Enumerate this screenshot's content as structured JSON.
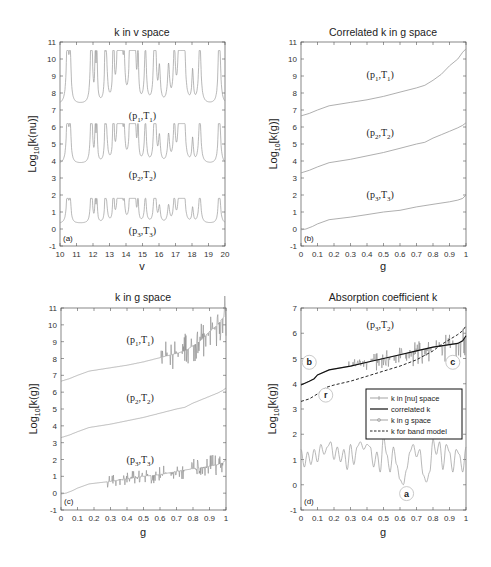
{
  "chart_data": [
    {
      "id": "a",
      "type": "line",
      "title": "k in v space",
      "xlabel": "v",
      "ylabel": "Log10[k(nu)]",
      "xlim": [
        10,
        20
      ],
      "ylim": [
        -1,
        11
      ],
      "xticks": [
        "10",
        "11",
        "12",
        "13",
        "14",
        "15",
        "16",
        "17",
        "18",
        "19",
        "20"
      ],
      "yticks": [
        "-1",
        "0",
        "1",
        "2",
        "3",
        "4",
        "5",
        "6",
        "7",
        "8",
        "9",
        "10",
        "11"
      ],
      "panel_tag": "(a)",
      "annotations": [
        {
          "text": "(p1,T1)",
          "main": "(p",
          "s1": "1",
          "mid": ",T",
          "s2": "1",
          "x": 15,
          "y": 6.5
        },
        {
          "text": "(p2,T2)",
          "main": "(p",
          "s1": "2",
          "mid": ",T",
          "s2": "2",
          "x": 15,
          "y": 3.0
        },
        {
          "text": "(p3,T3)",
          "main": "(p",
          "s1": "3",
          "mid": ",T",
          "s2": "3",
          "x": 15,
          "y": -0.3
        }
      ],
      "series": [
        {
          "name": "(p1,T1)",
          "baseline": 7.3,
          "peak": 10.5,
          "style": "gray-line"
        },
        {
          "name": "(p2,T2)",
          "baseline": 3.8,
          "peak": 6.2,
          "style": "gray-line"
        },
        {
          "name": "(p3,T3)",
          "baseline": 0.3,
          "peak": 1.8,
          "style": "gray-line"
        }
      ],
      "grid": false
    },
    {
      "id": "b",
      "type": "line",
      "title": "Correlated k in g space",
      "xlabel": "g",
      "ylabel": "Log10[k(g)]",
      "xlim": [
        0,
        1
      ],
      "ylim": [
        -1,
        11
      ],
      "xticks": [
        "0",
        "0.1",
        "0.2",
        "0.3",
        "0.4",
        "0.5",
        "0.6",
        "0.7",
        "0.8",
        "0.9",
        "1"
      ],
      "yticks": [
        "-1",
        "0",
        "1",
        "2",
        "3",
        "4",
        "5",
        "6",
        "7",
        "8",
        "9",
        "10",
        "11"
      ],
      "panel_tag": "(b)",
      "annotations": [
        {
          "text": "(p1,T1)",
          "main": "(p",
          "s1": "1",
          "mid": ",T",
          "s2": "1",
          "x": 0.48,
          "y": 8.9
        },
        {
          "text": "(p2,T2)",
          "main": "(p",
          "s1": "2",
          "mid": ",T",
          "s2": "2",
          "x": 0.48,
          "y": 5.5
        },
        {
          "text": "(p3,T3)",
          "main": "(p",
          "s1": "3",
          "mid": ",T",
          "s2": "3",
          "x": 0.48,
          "y": 1.8
        }
      ],
      "series": [
        {
          "name": "(p1,T1)",
          "x": [
            0,
            0.05,
            0.1,
            0.17,
            0.3,
            0.4,
            0.5,
            0.6,
            0.7,
            0.75,
            0.8,
            0.85,
            0.9,
            0.95,
            0.98,
            1.0
          ],
          "y": [
            6.65,
            6.8,
            7.0,
            7.25,
            7.45,
            7.6,
            7.8,
            8.05,
            8.3,
            8.45,
            8.75,
            9.1,
            9.6,
            10.0,
            10.4,
            10.6
          ]
        },
        {
          "name": "(p2,T2)",
          "x": [
            0,
            0.05,
            0.1,
            0.17,
            0.3,
            0.4,
            0.5,
            0.6,
            0.7,
            0.75,
            0.8,
            0.85,
            0.9,
            0.95,
            0.98,
            1.0
          ],
          "y": [
            3.3,
            3.45,
            3.65,
            3.9,
            4.1,
            4.3,
            4.5,
            4.75,
            5.0,
            5.1,
            5.35,
            5.55,
            5.75,
            5.95,
            6.1,
            6.25
          ]
        },
        {
          "name": "(p3,T3)",
          "x": [
            0,
            0.03,
            0.07,
            0.1,
            0.17,
            0.3,
            0.4,
            0.5,
            0.6,
            0.7,
            0.8,
            0.9,
            0.95,
            0.98,
            1.0
          ],
          "y": [
            -0.05,
            0.0,
            0.15,
            0.3,
            0.55,
            0.7,
            0.85,
            1.0,
            1.1,
            1.3,
            1.45,
            1.6,
            1.7,
            1.8,
            2.0
          ]
        }
      ],
      "grid": false
    },
    {
      "id": "c",
      "type": "line",
      "title": "k in g space",
      "xlabel": "g",
      "ylabel": "Log10[k(g)]",
      "xlim": [
        0,
        1
      ],
      "ylim": [
        -1,
        11
      ],
      "xticks": [
        "0",
        "0.1",
        "0.2",
        "0.3",
        "0.4",
        "0.5",
        "0.6",
        "0.7",
        "0.8",
        "0.9",
        "1"
      ],
      "yticks": [
        "-1",
        "0",
        "1",
        "2",
        "3",
        "4",
        "5",
        "6",
        "7",
        "8",
        "9",
        "10",
        "11"
      ],
      "panel_tag": "(c)",
      "annotations": [
        {
          "text": "(p1,T1)",
          "main": "(p",
          "s1": "1",
          "mid": ",T",
          "s2": "1",
          "x": 0.48,
          "y": 8.9
        },
        {
          "text": "(p2,T2)",
          "main": "(p",
          "s1": "2",
          "mid": ",T",
          "s2": "2",
          "x": 0.48,
          "y": 5.5
        },
        {
          "text": "(p3,T3)",
          "main": "(p",
          "s1": "3",
          "mid": ",T",
          "s2": "3",
          "x": 0.48,
          "y": 1.8
        }
      ],
      "series": [
        {
          "name": "(p1,T1)",
          "noisy_from": 0.6,
          "noise_amp": 0.9
        },
        {
          "name": "(p2,T2)",
          "noisy_from": 1.1,
          "noise_amp": 0
        },
        {
          "name": "(p3,T3)",
          "noisy_from": 0.28,
          "noise_amp": 0.5
        }
      ],
      "grid": false
    },
    {
      "id": "d",
      "type": "line",
      "title": "Absorption coefficient k",
      "xlabel": "g",
      "ylabel": "Log10[k(g)]",
      "xlim": [
        0,
        1
      ],
      "ylim": [
        -1,
        7
      ],
      "xticks": [
        "0",
        "0.1",
        "0.2",
        "0.3",
        "0.4",
        "0.5",
        "0.6",
        "0.7",
        "0.8",
        "0.9",
        "1"
      ],
      "yticks": [
        "-1",
        "0",
        "1",
        "2",
        "3",
        "4",
        "5",
        "6",
        "7"
      ],
      "panel_tag": "(d)",
      "annotations": [
        {
          "text": "(p3,T2)",
          "main": "(p",
          "s1": "3",
          "mid": ",T",
          "s2": "2",
          "x": 0.48,
          "y": 6.2
        }
      ],
      "markers": [
        {
          "label": "b",
          "x": 0.05,
          "y": 4.85
        },
        {
          "label": "r",
          "x": 0.15,
          "y": 3.55
        },
        {
          "label": "c",
          "x": 0.92,
          "y": 4.85
        },
        {
          "label": "a",
          "x": 0.64,
          "y": -0.35
        }
      ],
      "legend": {
        "position": "center-right",
        "entries": [
          {
            "label": "k in [nu] space",
            "style": "gray-marker"
          },
          {
            "label": "correlated k",
            "style": "black-solid"
          },
          {
            "label": "k in g space",
            "style": "gray-circle"
          },
          {
            "label": "k for band model",
            "style": "black-dashed"
          }
        ]
      },
      "series": [
        {
          "name": "k in [nu] space",
          "x": [
            0,
            0.02,
            0.04,
            0.06,
            0.08,
            0.1,
            0.12,
            0.14,
            0.16,
            0.18,
            0.2,
            0.22,
            0.24,
            0.26,
            0.28,
            0.3,
            0.32,
            0.34,
            0.36,
            0.38,
            0.4,
            0.42,
            0.44,
            0.46,
            0.48,
            0.5,
            0.52,
            0.54,
            0.56,
            0.58,
            0.6,
            0.62,
            0.64,
            0.66,
            0.68,
            0.7,
            0.72,
            0.74,
            0.76,
            0.78,
            0.8,
            0.82,
            0.84,
            0.86,
            0.88,
            0.9,
            0.92,
            0.94,
            0.96,
            0.98,
            1.0
          ],
          "y": [
            1.4,
            0.7,
            1.3,
            0.8,
            1.4,
            0.9,
            1.6,
            1.2,
            1.5,
            1.7,
            1.0,
            1.5,
            0.9,
            1.4,
            0.6,
            1.6,
            0.8,
            1.5,
            1.7,
            1.4,
            1.6,
            1.5,
            0.7,
            1.3,
            0.5,
            1.9,
            1.2,
            0.5,
            1.5,
            0.8,
            0.2,
            0.0,
            0.6,
            1.3,
            1.6,
            1.1,
            1.4,
            0.4,
            0.1,
            0.5,
            1.8,
            1.2,
            1.7,
            0.6,
            1.6,
            1.3,
            0.5,
            1.4,
            1.2,
            0.5,
            1.5
          ]
        },
        {
          "name": "correlated k",
          "x": [
            0,
            0.05,
            0.08,
            0.1,
            0.17,
            0.3,
            0.4,
            0.5,
            0.6,
            0.7,
            0.8,
            0.9,
            0.95,
            0.98,
            1.0
          ],
          "y": [
            3.95,
            4.1,
            4.2,
            4.35,
            4.55,
            4.7,
            4.85,
            5.0,
            5.15,
            5.3,
            5.45,
            5.55,
            5.6,
            5.7,
            5.9
          ]
        },
        {
          "name": "k in g space",
          "noise_amp": 0.5,
          "noisy_from": 0.28
        },
        {
          "name": "k for band model",
          "x": [
            0,
            0.05,
            0.1,
            0.15,
            0.2,
            0.3,
            0.4,
            0.5,
            0.6,
            0.7,
            0.8,
            0.85,
            0.9,
            0.95,
            0.98,
            1.0
          ],
          "y": [
            3.3,
            3.4,
            3.6,
            3.85,
            3.95,
            4.1,
            4.3,
            4.5,
            4.7,
            4.95,
            5.3,
            5.55,
            5.75,
            5.95,
            6.1,
            6.3
          ]
        }
      ],
      "grid": false
    }
  ]
}
